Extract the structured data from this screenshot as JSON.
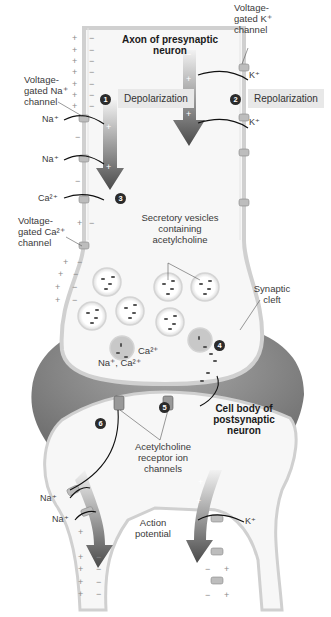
{
  "figure": {
    "title_presynaptic": "Axon of presynaptic neuron",
    "title_postsynaptic": "Cell body of postsynaptic neuron",
    "steps": [
      {
        "num": "1",
        "label": "Depolarization"
      },
      {
        "num": "2",
        "label": "Repolarization"
      },
      {
        "num": "3",
        "label": ""
      },
      {
        "num": "4",
        "label": ""
      },
      {
        "num": "5",
        "label": ""
      },
      {
        "num": "6",
        "label": ""
      }
    ],
    "labels": {
      "na_channel": "Voltage-gated Na⁺ channel",
      "k_channel": "Voltage-gated K⁺ channel",
      "ca_channel": "Voltage-gated Ca²⁺ channel",
      "vesicles": "Secretory vesicles containing acetylcholine",
      "cleft": "Synaptic cleft",
      "receptors": "Acetylcholine receptor ion channels",
      "action_potential": "Action potential",
      "na_ca_ions": "Na⁺, Ca²⁺",
      "ca_ion": "Ca²⁺"
    },
    "ions": {
      "na": "Na⁺",
      "k": "K⁺",
      "ca": "Ca²⁺"
    },
    "colors": {
      "membrane": "#d6d6d6",
      "cleft": "#7a7a7a",
      "arrow_dark": "#555555",
      "step_bg": "#e8e8e8",
      "step_circle": "#2b2b2b"
    }
  }
}
